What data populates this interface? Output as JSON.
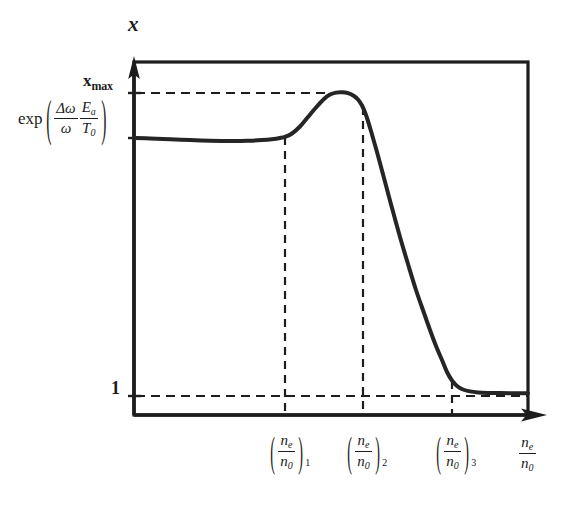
{
  "figure": {
    "background_color": "#ffffff",
    "line_color": "#1d1d1d",
    "curve_color": "#252525"
  },
  "axes": {
    "y_axis_name": "x",
    "x_axis_name_numerator": "n",
    "x_axis_name_numerator_sub": "e",
    "x_axis_name_denominator": "n",
    "x_axis_name_denominator_sub": "0",
    "y_ticks": [
      {
        "name": "x-max",
        "main": "x",
        "sub": "max",
        "value_pixel_y": 93
      },
      {
        "name": "unity",
        "main": "1",
        "value_pixel_y": 396
      },
      {
        "name": "exp-expression",
        "fn": "exp",
        "paren_open": "(",
        "paren_close": ")",
        "frac1_num": "Δω",
        "frac1_den": "ω",
        "frac2_num": "E",
        "frac2_num_sub": "a",
        "frac2_den": "T",
        "frac2_den_sub": "0",
        "value_pixel_y": 138
      }
    ],
    "x_ticks": [
      {
        "name": "n-e-over-n-0-1",
        "num": "n",
        "num_sub": "e",
        "den": "n",
        "den_sub": "0",
        "index": "1",
        "pixel_x": 285
      },
      {
        "name": "n-e-over-n-0-2",
        "num": "n",
        "num_sub": "e",
        "den": "n",
        "den_sub": "0",
        "index": "2",
        "pixel_x": 363
      },
      {
        "name": "n-e-over-n-0-3",
        "num": "n",
        "num_sub": "e",
        "den": "n",
        "den_sub": "0",
        "index": "3",
        "pixel_x": 452
      }
    ]
  },
  "chart_data": {
    "type": "line",
    "title": "",
    "xlabel": "n_e / n_0",
    "ylabel": "x",
    "grid": false,
    "legend": null,
    "annotations": [
      {
        "text": "x_max",
        "kind": "y-reference-dashed",
        "y": 93
      },
      {
        "text": "1",
        "kind": "y-reference-dashed",
        "y": 396
      },
      {
        "text": "(n_e/n_0)_1",
        "kind": "x-reference-dashed",
        "x": 285
      },
      {
        "text": "(n_e/n_0)_2",
        "kind": "x-reference-dashed",
        "x": 363
      },
      {
        "text": "(n_e/n_0)_3",
        "kind": "x-reference-dashed",
        "x": 452
      }
    ],
    "axis_pixel_ranges": {
      "x": [
        134,
        528
      ],
      "y_top": 62,
      "y_bottom": 415
    },
    "y_reference_levels": {
      "x_max": 93,
      "exp_level": 138,
      "unity": 396
    },
    "series": [
      {
        "name": "x-versus-electron-density",
        "description": "Plateau near exp(dw/w Ea/T0), gentle dip, rise to maximum x_max just past (n_e/n_0)_1, peak, then steep fall after (n_e/n_0)_2 down to unity near (n_e/n_0)_3, asymptotic tail at 1.",
        "points_pixel": [
          [
            134,
            138
          ],
          [
            150,
            138.5
          ],
          [
            170,
            139.3
          ],
          [
            190,
            140.1
          ],
          [
            210,
            140.7
          ],
          [
            230,
            141.0
          ],
          [
            248,
            140.8
          ],
          [
            262,
            140.1
          ],
          [
            272,
            139.2
          ],
          [
            280,
            138.0
          ],
          [
            285,
            136.8
          ],
          [
            292,
            133.5
          ],
          [
            300,
            126.5
          ],
          [
            308,
            117.0
          ],
          [
            316,
            107.5
          ],
          [
            324,
            99.0
          ],
          [
            330,
            94.6
          ],
          [
            336,
            92.6
          ],
          [
            342,
            92.2
          ],
          [
            348,
            93.2
          ],
          [
            354,
            96.0
          ],
          [
            358,
            99.5
          ],
          [
            362,
            105.5
          ],
          [
            366,
            115.0
          ],
          [
            371,
            131.0
          ],
          [
            377,
            152.0
          ],
          [
            384,
            178.0
          ],
          [
            392,
            208.0
          ],
          [
            400,
            237.0
          ],
          [
            408,
            264.0
          ],
          [
            416,
            290.0
          ],
          [
            424,
            313.0
          ],
          [
            430,
            330.0
          ],
          [
            436,
            346.0
          ],
          [
            442,
            360.0
          ],
          [
            447,
            372.0
          ],
          [
            452,
            380.5
          ],
          [
            457,
            386.0
          ],
          [
            463,
            389.5
          ],
          [
            470,
            391.4
          ],
          [
            478,
            392.4
          ],
          [
            488,
            392.9
          ],
          [
            500,
            393.1
          ],
          [
            514,
            393.2
          ],
          [
            528,
            393.3
          ]
        ]
      }
    ]
  }
}
